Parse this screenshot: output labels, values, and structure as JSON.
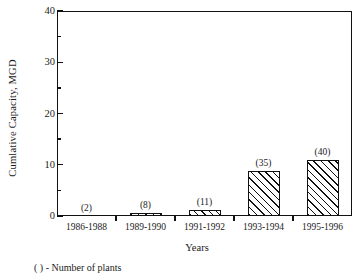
{
  "chart_data": {
    "type": "bar",
    "title": "",
    "xlabel": "Years",
    "ylabel": "Cumlative Capacity, MGD",
    "categories": [
      "1986-1988",
      "1989-1990",
      "1991-1992",
      "1993-1994",
      "1995-1996"
    ],
    "values": [
      0.05,
      0.5,
      1.2,
      8.8,
      11.0
    ],
    "point_labels": [
      "(2)",
      "(8)",
      "(11)",
      "(35)",
      "(40)"
    ],
    "ylim": [
      0,
      40
    ],
    "yticks_major": [
      0,
      10,
      20,
      30,
      40
    ],
    "yticks_major_labels": [
      "0",
      "10",
      "20",
      "30",
      "40"
    ],
    "yticks_minor": [
      5,
      15,
      25,
      35
    ],
    "grid": false,
    "legend": false,
    "footnote": "( ) - Number of plants",
    "bar_fill": "hatched-diagonal",
    "colors": {
      "axis": "#111111",
      "bar_edge": "#111111",
      "bar_hatch": "#111111",
      "background": "#ffffff"
    }
  }
}
